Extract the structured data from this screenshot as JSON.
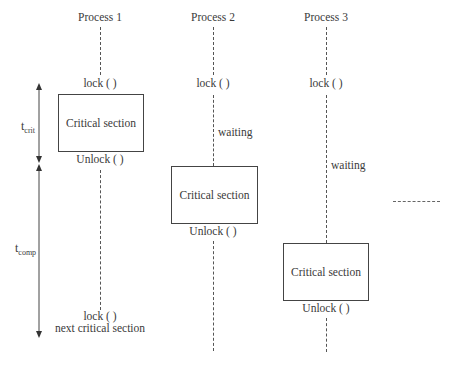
{
  "diagram": {
    "processes": [
      {
        "title": "Process 1",
        "lock_label": "lock ( )",
        "critical_section_label": "Critical section",
        "unlock_label": "Unlock ( )",
        "next_lock_label": "lock ( )",
        "next_section_label": "next critical section"
      },
      {
        "title": "Process 2",
        "lock_label": "lock ( )",
        "waiting_label": "waiting",
        "critical_section_label": "Critical section",
        "unlock_label": "Unlock ( )"
      },
      {
        "title": "Process 3",
        "lock_label": "lock ( )",
        "waiting_label": "waiting",
        "critical_section_label": "Critical section",
        "unlock_label": "Unlock ( )"
      }
    ],
    "time_labels": {
      "t_crit": {
        "base": "t",
        "sub": "crit"
      },
      "t_comp": {
        "base": "t",
        "sub": "comp"
      }
    }
  }
}
